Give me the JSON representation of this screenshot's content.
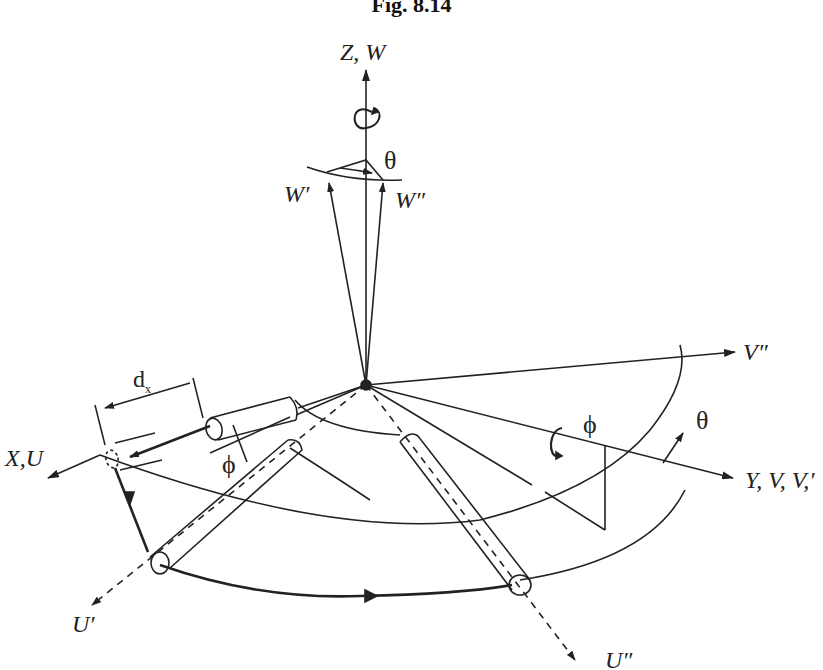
{
  "figure": {
    "caption": "Fig. 8.14",
    "labels": {
      "z_axis": "Z, W",
      "w_prime": "W′",
      "w_double_prime": "W″",
      "theta_top": "θ",
      "v_double_prime": "V″",
      "y_axis": "Y, V, V,′",
      "x_axis": "X,U",
      "dx": "d",
      "dx_sub": "x",
      "phi_left": "ϕ",
      "phi_right": "ϕ",
      "theta_right": "θ",
      "u_prime": "U′",
      "u_double_prime": "U″"
    },
    "colors": {
      "ink": "#222222",
      "background": "#ffffff"
    }
  }
}
